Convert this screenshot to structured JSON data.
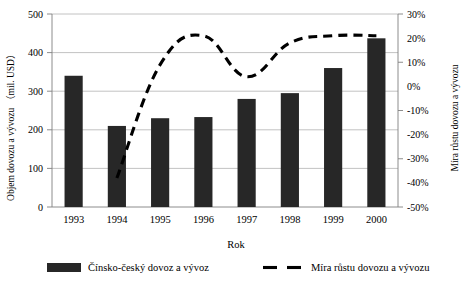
{
  "chart_data": {
    "type": "bar",
    "title": "",
    "xlabel": "Rok",
    "ylabel": "Objem dovozu a vývozu （mil. USD）",
    "y2label": "Míra růstu dovozu a vývozu",
    "categories": [
      "1993",
      "1994",
      "1995",
      "1996",
      "1997",
      "1998",
      "1999",
      "2000"
    ],
    "ylim": [
      0,
      500
    ],
    "y2lim": [
      -50,
      30
    ],
    "yticks": [
      0,
      100,
      200,
      300,
      400,
      500
    ],
    "ytick_labels": [
      "0",
      "100",
      "200",
      "300",
      "400",
      "500"
    ],
    "y2ticks": [
      -50,
      -40,
      -30,
      -20,
      -10,
      0,
      10,
      20,
      30
    ],
    "y2tick_labels": [
      "-50%",
      "-40%",
      "-30%",
      "-20%",
      "-10%",
      "0%",
      "10%",
      "20%",
      "30%"
    ],
    "gridlines": [
      0,
      100,
      200,
      300,
      400,
      500
    ],
    "grid": true,
    "legend_position": "bottom",
    "series": [
      {
        "name": "Čínsko-český dovoz a vývoz",
        "type": "bar",
        "axis": "left",
        "unit": "mil. USD",
        "values": [
          340,
          210,
          230,
          233,
          280,
          295,
          360,
          437
        ]
      },
      {
        "name": "Míra růstu dovozu a vývozu",
        "type": "line",
        "style": "dashed",
        "axis": "right",
        "unit": "%",
        "values": [
          null,
          -38,
          9,
          21,
          4,
          18,
          21,
          21
        ]
      }
    ]
  },
  "legend": {
    "items": [
      {
        "label": "Čínsko-český dovoz a vývoz",
        "marker": "filled-rect"
      },
      {
        "label": "Míra růstu dovozu a vývozu",
        "marker": "dashed-line"
      }
    ]
  }
}
